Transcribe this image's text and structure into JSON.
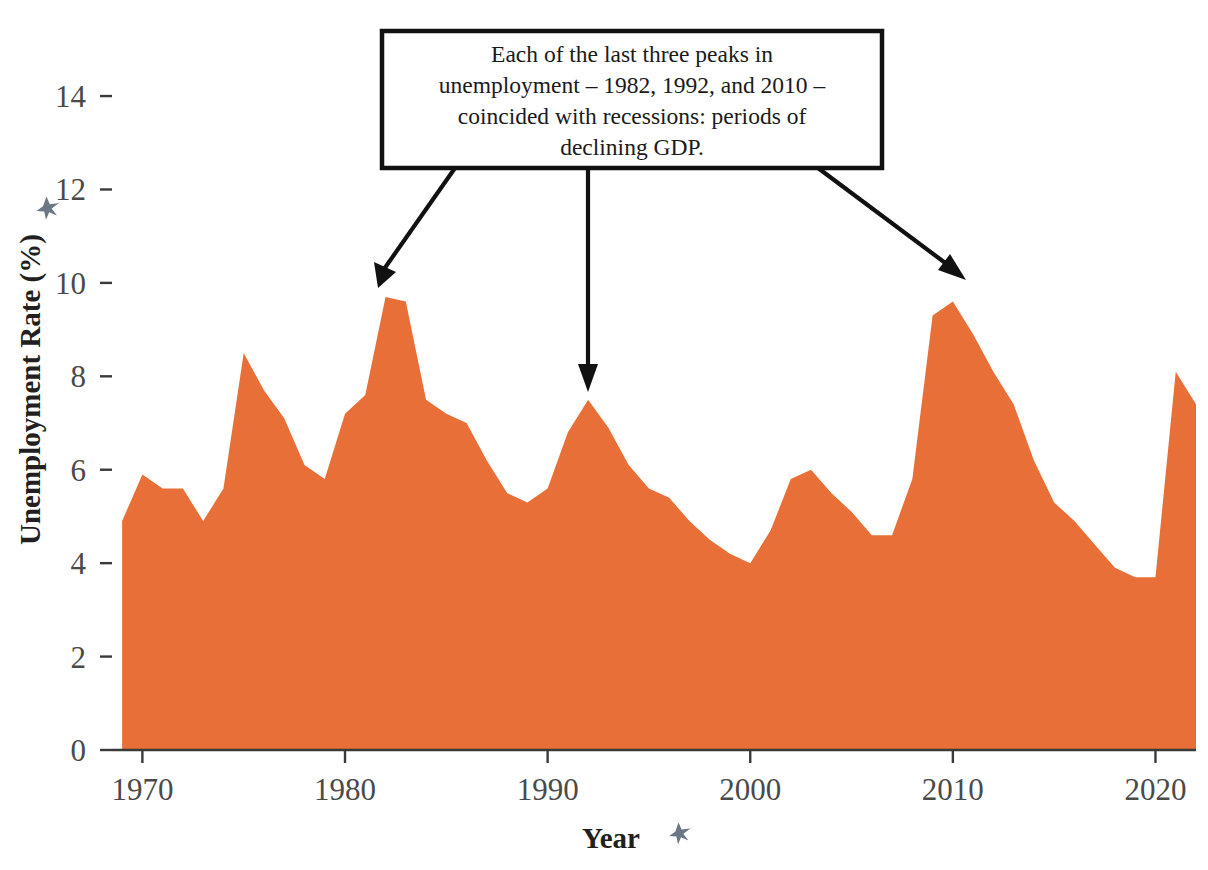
{
  "chart_data": {
    "type": "area",
    "title": "",
    "subtitle": "",
    "xlabel": "Year",
    "ylabel": "Unemployment Rate (%)",
    "xlim": [
      1968.5,
      1922.0
    ],
    "x_range": [
      1968.5,
      2022.0
    ],
    "ylim": [
      0,
      15.2
    ],
    "grid": false,
    "legend": "none",
    "series_color": "#E86F37",
    "x": [
      1969,
      1970,
      1971,
      1972,
      1973,
      1974,
      1975,
      1976,
      1977,
      1978,
      1979,
      1980,
      1981,
      1982,
      1983,
      1984,
      1985,
      1986,
      1987,
      1988,
      1989,
      1990,
      1991,
      1992,
      1993,
      1994,
      1995,
      1996,
      1997,
      1998,
      1999,
      2000,
      2001,
      2002,
      2003,
      2004,
      2005,
      2006,
      2007,
      2008,
      2009,
      2010,
      2011,
      2012,
      2013,
      2014,
      2015,
      2016,
      2017,
      2018,
      2019,
      2020,
      2021,
      2022
    ],
    "values": [
      4.9,
      5.9,
      5.6,
      5.6,
      4.9,
      5.6,
      8.5,
      7.7,
      7.1,
      6.1,
      5.8,
      7.2,
      7.6,
      9.7,
      9.6,
      7.5,
      7.2,
      7.0,
      6.2,
      5.5,
      5.3,
      5.6,
      6.8,
      7.5,
      6.9,
      6.1,
      5.6,
      5.4,
      4.9,
      4.5,
      4.2,
      4.0,
      4.7,
      5.8,
      6.0,
      5.5,
      5.1,
      4.6,
      4.6,
      5.8,
      9.3,
      9.6,
      8.9,
      8.1,
      7.4,
      6.2,
      5.3,
      4.9,
      4.4,
      3.9,
      3.7,
      3.7,
      8.1,
      7.4
    ],
    "series": [
      {
        "name": "Unemployment Rate (%)",
        "color": "#E86F37",
        "values": [
          4.9,
          5.9,
          5.6,
          5.6,
          4.9,
          5.6,
          8.5,
          7.7,
          7.1,
          6.1,
          5.8,
          7.2,
          7.6,
          9.7,
          9.6,
          7.5,
          7.2,
          7.0,
          6.2,
          5.5,
          5.3,
          5.6,
          6.8,
          7.5,
          6.9,
          6.1,
          5.6,
          5.4,
          4.9,
          4.5,
          4.2,
          4.0,
          4.7,
          5.8,
          6.0,
          5.5,
          5.1,
          4.6,
          4.6,
          5.8,
          9.3,
          9.6,
          8.9,
          8.1,
          7.4,
          6.2,
          5.3,
          4.9,
          4.4,
          3.9,
          3.7,
          3.7,
          8.1,
          7.4
        ]
      }
    ],
    "y_ticks": [
      0,
      2,
      4,
      6,
      8,
      10,
      12,
      14
    ],
    "y_tick_labels": [
      "0",
      "2",
      "4",
      "6",
      "8",
      "10",
      "12",
      "14"
    ],
    "x_ticks": [
      1970,
      1980,
      1990,
      2000,
      2010,
      2020
    ],
    "x_tick_labels": [
      "1970",
      "1980",
      "1990",
      "2000",
      "2010",
      "2020"
    ],
    "annotations": [
      {
        "id": "recession-callout",
        "lines": [
          "Each of the last three peaks in",
          "unemployment – 1982, 1992, and 2010 –",
          "coincided with recessions: periods of",
          "declining GDP."
        ],
        "points_to": [
          1982,
          1992,
          2010
        ]
      }
    ]
  },
  "axes": {
    "y_title": "Unemployment Rate (%)",
    "x_title": "Year",
    "y_tick_labels": [
      "14",
      "12",
      "10",
      "8",
      "6",
      "4",
      "2",
      "0"
    ],
    "x_tick_labels": [
      "1970",
      "1980",
      "1990",
      "2000",
      "2010",
      "2020"
    ]
  },
  "annotation": {
    "line1": "Each of the last three peaks in",
    "line2": "unemployment – 1982, 1992, and 2010 –",
    "line3": "coincided with recessions: periods of",
    "line4": "declining GDP."
  },
  "icons": {
    "y_axis_pin": "pin-icon",
    "x_axis_pin": "pin-icon"
  },
  "colors": {
    "area": "#E86F37",
    "axis": "#3a3a3a",
    "tick_label": "#4a4a4a",
    "axis_title": "#231f20",
    "annotation_border": "#111111",
    "pin": "#6b7785",
    "background": "#ffffff"
  }
}
